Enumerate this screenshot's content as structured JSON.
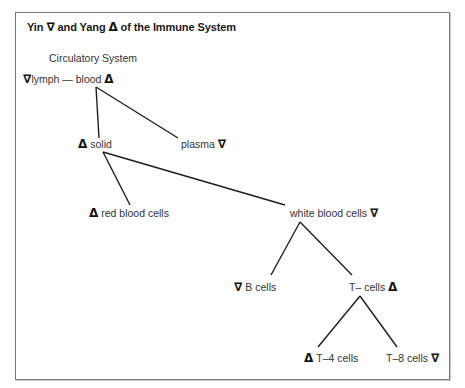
{
  "title": {
    "prefix": "Yin ",
    "yin_symbol": "∇",
    "middle": " and Yang ",
    "yang_symbol": "Δ",
    "suffix": " of the Immune System"
  },
  "subtitle": "Circulatory System",
  "legend_meaning": {
    "∇": "yin",
    "Δ": "yang"
  },
  "nodes": {
    "root": {
      "pre_symbol": "∇",
      "label": "lymph — blood",
      "post_symbol": "Δ"
    },
    "solid": {
      "pre_symbol": "Δ",
      "label": " solid",
      "post_symbol": ""
    },
    "plasma": {
      "pre_symbol": "",
      "label": "plasma ",
      "post_symbol": "∇"
    },
    "red_blood_cells": {
      "pre_symbol": "Δ",
      "label": " red blood cells",
      "post_symbol": ""
    },
    "white_blood_cells": {
      "pre_symbol": "",
      "label": "white blood cells ",
      "post_symbol": "∇"
    },
    "b_cells": {
      "pre_symbol": "∇",
      "label": "  B cells",
      "post_symbol": ""
    },
    "t_cells": {
      "pre_symbol": "",
      "label": "T– cells  ",
      "post_symbol": "Δ"
    },
    "t4_cells": {
      "pre_symbol": "Δ",
      "label": "  T–4 cells",
      "post_symbol": ""
    },
    "t8_cells": {
      "pre_symbol": "",
      "label": "T–8 cells ",
      "post_symbol": "∇"
    }
  },
  "edges": [
    {
      "from": "root",
      "to": "solid"
    },
    {
      "from": "root",
      "to": "plasma"
    },
    {
      "from": "solid",
      "to": "red_blood_cells"
    },
    {
      "from": "solid",
      "to": "white_blood_cells"
    },
    {
      "from": "white_blood_cells",
      "to": "b_cells"
    },
    {
      "from": "white_blood_cells",
      "to": "t_cells"
    },
    {
      "from": "t_cells",
      "to": "t4_cells"
    },
    {
      "from": "t_cells",
      "to": "t8_cells"
    }
  ]
}
